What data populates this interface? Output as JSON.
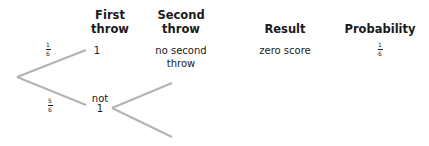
{
  "headers": {
    "first_throw": "First\nthrow",
    "second_throw": "Second\nthrow",
    "result": "Result",
    "probability": "Probability"
  },
  "branches": {
    "upper": {
      "probability_num": "1",
      "probability_den": "6",
      "outcome": "1"
    },
    "lower": {
      "probability_num": "5",
      "probability_den": "6",
      "outcome_line1": "not",
      "outcome_line2": "1"
    }
  },
  "row1": {
    "second_throw": "no second\nthrow",
    "result": "zero score",
    "probability_num": "1",
    "probability_den": "6"
  },
  "colors": {
    "line": "#b3b3b3",
    "text": "#1a1a1a"
  }
}
